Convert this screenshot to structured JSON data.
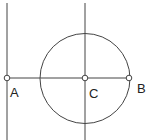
{
  "diagram": {
    "type": "geometric-construction",
    "stroke_color": "#444444",
    "points": [
      {
        "id": "A",
        "label": "A",
        "x": 7,
        "y": 78,
        "label_x": 10,
        "label_y": 97
      },
      {
        "id": "C",
        "label": "C",
        "x": 85,
        "y": 78,
        "label_x": 89,
        "label_y": 98
      },
      {
        "id": "B",
        "label": "B",
        "x": 129,
        "y": 78,
        "label_x": 137,
        "label_y": 93
      }
    ],
    "circle": {
      "cx": 85,
      "cy": 78.5,
      "r": 45
    },
    "lines": [
      {
        "name": "vertical-line-through-A",
        "x1": 7,
        "y1": 3,
        "x2": 7,
        "y2": 140
      },
      {
        "name": "vertical-line-through-C",
        "x1": 85,
        "y1": 3,
        "x2": 85,
        "y2": 140
      },
      {
        "name": "segment-AB",
        "x1": 7,
        "y1": 78,
        "x2": 129,
        "y2": 78
      }
    ]
  }
}
